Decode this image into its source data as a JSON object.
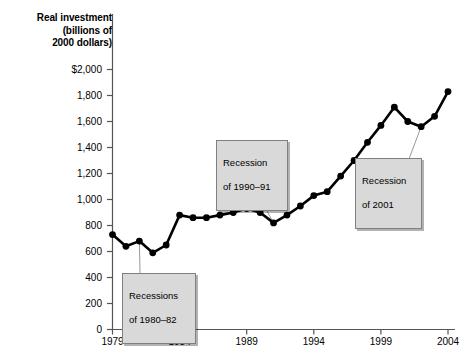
{
  "chart_data": {
    "type": "line",
    "title": "Real investment (billions of 2000 dollars)",
    "title_lines": [
      "Real investment",
      "(billions of",
      "2000 dollars)"
    ],
    "xlabel": "",
    "ylabel": "Real investment (billions of 2000 dollars)",
    "xlim": [
      1979,
      2004
    ],
    "ylim": [
      0,
      2000
    ],
    "grid": false,
    "legend_position": "none",
    "y_ticks": [
      0,
      200,
      400,
      600,
      800,
      1000,
      1200,
      1400,
      1600,
      1800,
      2000
    ],
    "y_tick_labels": [
      "0",
      "200",
      "400",
      "600",
      "800",
      "1,000",
      "1,200",
      "1,400",
      "1,600",
      "1,800",
      "$2,000"
    ],
    "x_ticks": [
      1979,
      1984,
      1989,
      1994,
      1999,
      2004
    ],
    "x_tick_labels": [
      "1979",
      "1984",
      "1989",
      "1994",
      "1999",
      "2004"
    ],
    "x": [
      1979,
      1980,
      1981,
      1982,
      1983,
      1984,
      1985,
      1986,
      1987,
      1988,
      1989,
      1990,
      1991,
      1992,
      1993,
      1994,
      1995,
      1996,
      1997,
      1998,
      1999,
      2000,
      2001,
      2002,
      2003,
      2004
    ],
    "values": [
      730,
      640,
      680,
      590,
      650,
      880,
      860,
      860,
      880,
      900,
      930,
      900,
      820,
      880,
      950,
      1030,
      1060,
      1180,
      1300,
      1440,
      1570,
      1710,
      1600,
      1560,
      1640,
      1830
    ],
    "series": [
      {
        "name": "Real investment",
        "values": [
          730,
          640,
          680,
          590,
          650,
          880,
          860,
          860,
          880,
          900,
          930,
          900,
          820,
          880,
          950,
          1030,
          1060,
          1180,
          1300,
          1440,
          1570,
          1710,
          1600,
          1560,
          1640,
          1830
        ]
      }
    ],
    "line_color": "#000000",
    "marker_color": "#000000",
    "marker": "circle",
    "annotations": [
      {
        "id": "recessions-1980-82",
        "text": "Recessions\nof 1980–82",
        "line1": "Recessions",
        "line2": "of 1980–82",
        "points_to_year": 1981,
        "points_to_value": 680
      },
      {
        "id": "recession-1990-91",
        "text": "Recession\nof 1990–91",
        "line1": "Recession",
        "line2": "of 1990–91",
        "points_to_year": 1991,
        "points_to_value": 820
      },
      {
        "id": "recession-2001",
        "text": "Recession\nof 2001",
        "line1": "Recession",
        "line2": "of 2001",
        "points_to_year": 2002,
        "points_to_value": 1560
      }
    ]
  },
  "colors": {
    "callout_fill": "#d9d9d9",
    "callout_border": "#808080",
    "axis": "#555555",
    "data": "#000000"
  }
}
